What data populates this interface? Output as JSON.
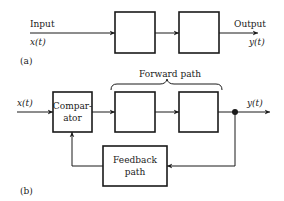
{
  "diagram": {
    "part_a": {
      "caption": "(a)",
      "input_label": "Input",
      "input_signal": "x(t)",
      "output_label": "Output",
      "output_signal": "y(t)",
      "blocks": [
        {
          "label": ""
        },
        {
          "label": ""
        }
      ]
    },
    "part_b": {
      "caption": "(b)",
      "input_signal": "x(t)",
      "output_signal": "y(t)",
      "forward_path_label": "Forward path",
      "comparator": {
        "line1": "Compar-",
        "line2": "ator"
      },
      "feedback": {
        "line1": "Feedback",
        "line2": "path"
      },
      "blocks": [
        {
          "label": ""
        },
        {
          "label": ""
        }
      ]
    }
  },
  "colors": {
    "ink": "#1a1a1a",
    "background": "#ffffff"
  }
}
